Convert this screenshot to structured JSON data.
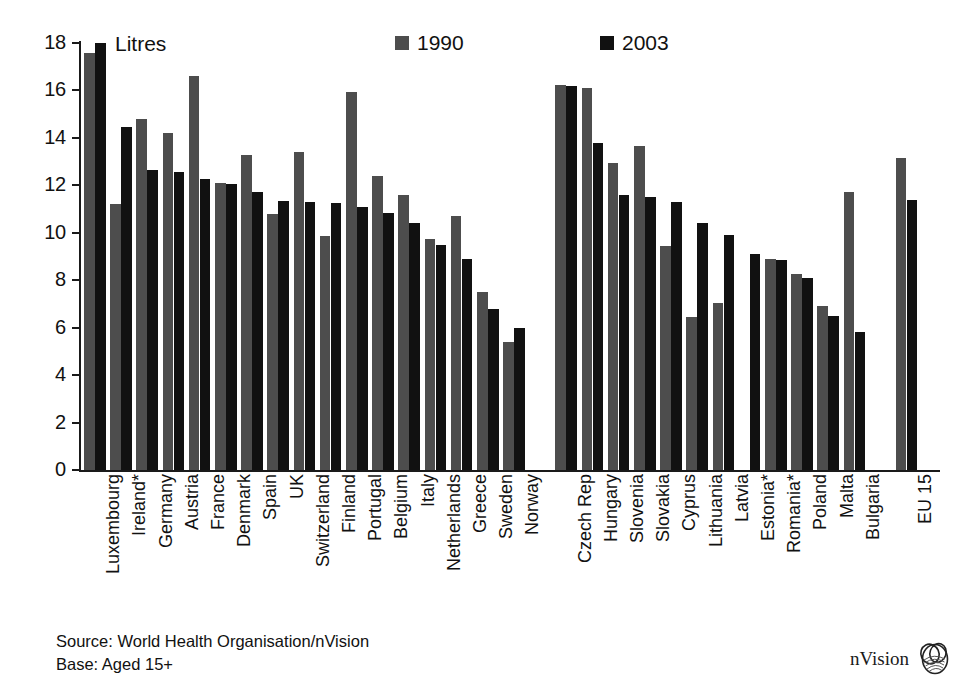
{
  "chart_data": {
    "type": "bar",
    "title": "",
    "unit_label": "Litres",
    "xlabel": "",
    "ylabel": "Litres",
    "ylim": [
      0,
      18
    ],
    "ytick_step": 2,
    "yticks": [
      "0",
      "2",
      "4",
      "6",
      "8",
      "10",
      "12",
      "14",
      "16",
      "18"
    ],
    "grid": false,
    "legend_position": "top-center",
    "categories": [
      "Luxembourg",
      "Ireland*",
      "Germany",
      "Austria",
      "France",
      "Denmark",
      "Spain",
      "UK",
      "Switzerland",
      "Finland",
      "Portugal",
      "Belgium",
      "Italy",
      "Netherlands",
      "Greece",
      "Sweden",
      "Norway",
      "Czech Rep",
      "Hungary",
      "Slovenia",
      "Slovakia",
      "Cyprus",
      "Lithuania",
      "Latvia",
      "Estonia*",
      "Romania*",
      "Poland",
      "Malta",
      "Bulgaria",
      "EU 15"
    ],
    "series": [
      {
        "name": "1990",
        "color": "#4d4d4d",
        "values": [
          17.6,
          11.2,
          14.8,
          14.2,
          16.6,
          12.1,
          13.3,
          10.8,
          13.4,
          9.85,
          15.95,
          12.4,
          11.6,
          9.75,
          10.7,
          7.5,
          5.4,
          16.25,
          16.1,
          12.95,
          13.65,
          9.45,
          6.45,
          7.05,
          null,
          8.9,
          8.25,
          6.9,
          11.7,
          13.15
        ]
      },
      {
        "name": "2003",
        "color": "#111111",
        "values": [
          18.0,
          14.45,
          12.65,
          12.55,
          12.25,
          12.05,
          11.7,
          11.35,
          11.3,
          11.25,
          11.1,
          10.85,
          10.4,
          9.5,
          8.9,
          6.8,
          6.0,
          16.2,
          13.8,
          11.6,
          11.5,
          11.3,
          10.4,
          9.9,
          9.1,
          8.85,
          8.1,
          6.5,
          5.8,
          11.4
        ]
      }
    ],
    "group_breaks_after": [
      "Norway",
      "Bulgaria"
    ],
    "annotations": []
  },
  "legend": {
    "items": [
      {
        "label": "1990",
        "color": "#4d4d4d"
      },
      {
        "label": "2003",
        "color": "#111111"
      }
    ]
  },
  "footer": {
    "source_line": "Source: World Health Organisation/nVision",
    "base_line": "Base: Aged 15+"
  },
  "brand": {
    "name": "nVision"
  }
}
